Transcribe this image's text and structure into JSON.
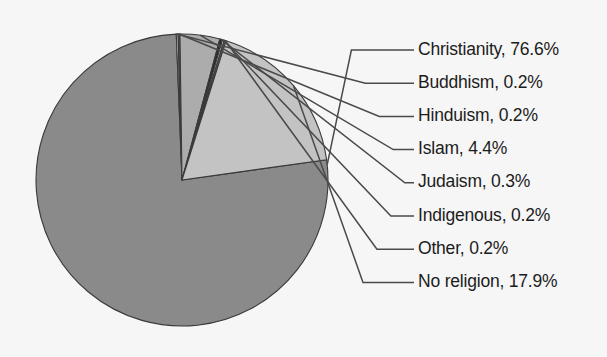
{
  "chart_data": {
    "type": "pie",
    "title": "",
    "subtitle": "",
    "xlabel": "",
    "ylabel": "",
    "legend_position": "none",
    "label_format": "name, percent",
    "grid": false,
    "categories": [
      "Christianity",
      "Buddhism",
      "Hinduism",
      "Islam",
      "Judaism",
      "Indigenous",
      "Other",
      "No religion"
    ],
    "values": [
      76.6,
      0.2,
      0.2,
      4.4,
      0.3,
      0.2,
      0.2,
      17.9
    ],
    "value_unit": "%",
    "total": 100.0,
    "colors": [
      "#8a8a8a",
      "#d9d9d9",
      "#5c5c5c",
      "#acacac",
      "#2b2b2b",
      "#e2e2e2",
      "#6f6f6f",
      "#c3c3c3"
    ],
    "slices": [
      {
        "label": "Christianity, 76.6%",
        "name": "Christianity",
        "value": 76.6,
        "color": "#8a8a8a"
      },
      {
        "label": "Buddhism, 0.2%",
        "name": "Buddhism",
        "value": 0.2,
        "color": "#d9d9d9"
      },
      {
        "label": "Hinduism, 0.2%",
        "name": "Hinduism",
        "value": 0.2,
        "color": "#5c5c5c"
      },
      {
        "label": "Islam, 4.4%",
        "name": "Islam",
        "value": 4.4,
        "color": "#acacac"
      },
      {
        "label": "Judaism, 0.3%",
        "name": "Judaism",
        "value": 0.3,
        "color": "#2b2b2b"
      },
      {
        "label": "Indigenous, 0.2%",
        "name": "Indigenous",
        "value": 0.2,
        "color": "#e2e2e2"
      },
      {
        "label": "Other, 0.2%",
        "name": "Other",
        "value": 0.2,
        "color": "#6f6f6f"
      },
      {
        "label": "No religion, 17.9%",
        "name": "No religion",
        "value": 17.9,
        "color": "#c3c3c3"
      }
    ],
    "background_color": "#f6f6f6",
    "outline_color": "#3a3a3a",
    "leader_line_color": "#4a4a4a"
  },
  "labels": {
    "l0": "Christianity, 76.6%",
    "l1": "Buddhism, 0.2%",
    "l2": "Hinduism, 0.2%",
    "l3": "Islam, 4.4%",
    "l4": "Judaism, 0.3%",
    "l5": "Indigenous, 0.2%",
    "l6": "Other, 0.2%",
    "l7": "No religion, 17.9%"
  }
}
